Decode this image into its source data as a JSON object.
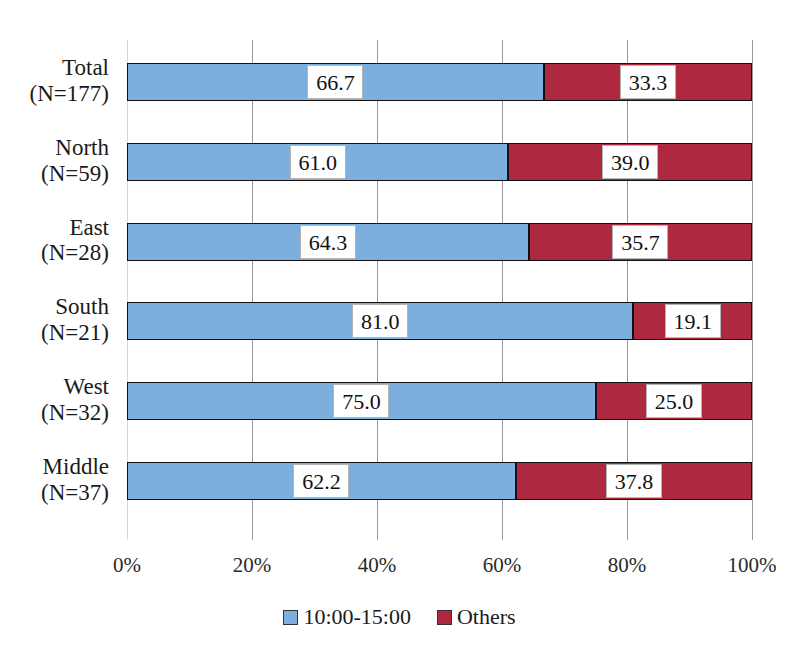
{
  "chart_data": {
    "type": "bar",
    "orientation": "horizontal",
    "stacked": true,
    "normalized_percent": true,
    "title": "",
    "subtitle": "",
    "xlabel": "",
    "ylabel": "",
    "xlim": [
      0,
      100
    ],
    "xticks": [
      0,
      20,
      40,
      60,
      80,
      100
    ],
    "xtick_labels": [
      "0%",
      "20%",
      "40%",
      "60%",
      "80%",
      "100%"
    ],
    "grid": true,
    "legend_position": "bottom-center",
    "categories": [
      "Total",
      "North",
      "East",
      "South",
      "West",
      "Middle"
    ],
    "category_counts": [
      "(N=177)",
      "(N=59)",
      "(N=28)",
      "(N=21)",
      "(N=32)",
      "(N=37)"
    ],
    "category_labels": [
      {
        "name": "Total",
        "n": "(N=177)"
      },
      {
        "name": "North",
        "n": "(N=59)"
      },
      {
        "name": "East",
        "n": "(N=28)"
      },
      {
        "name": "South",
        "n": "(N=21)"
      },
      {
        "name": "West",
        "n": "(N=32)"
      },
      {
        "name": "Middle",
        "n": "(N=37)"
      }
    ],
    "series": [
      {
        "name": "10:00-15:00",
        "color": "#7cafdd",
        "values": [
          66.7,
          61.0,
          64.3,
          81.0,
          75.0,
          62.2
        ],
        "value_labels": [
          "66.7",
          "61.0",
          "64.3",
          "81.0",
          "75.0",
          "62.2"
        ]
      },
      {
        "name": "Others",
        "color": "#ae2940",
        "values": [
          33.3,
          39.0,
          35.7,
          19.1,
          25.0,
          37.8
        ],
        "value_labels": [
          "33.3",
          "39.0",
          "35.7",
          "19.1",
          "25.0",
          "37.8"
        ]
      }
    ]
  },
  "legend": {
    "items": [
      {
        "label": "10:00-15:00",
        "color": "#7cafdd"
      },
      {
        "label": "Others",
        "color": "#ae2940"
      }
    ]
  },
  "colors": {
    "series_a": "#7cafdd",
    "series_b": "#ae2940",
    "bar_outline": "#111111",
    "gridline": "#9a9a9a",
    "background": "#ffffff",
    "text": "#1a1a1a"
  }
}
